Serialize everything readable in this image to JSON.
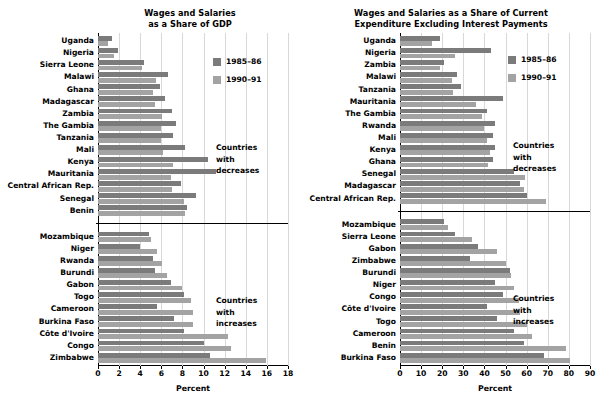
{
  "chart_data": [
    {
      "id": "left",
      "type": "bar",
      "orientation": "horizontal",
      "title": "Wages and Salaries\nas a Share of GDP",
      "title_line1": "Wages and Salaries",
      "title_line2": "as a Share of GDP",
      "xlabel": "Percent",
      "ylabel": "",
      "xlim": [
        0,
        18
      ],
      "xticks": [
        0,
        2,
        4,
        6,
        8,
        10,
        12,
        14,
        16,
        18
      ],
      "grid": "vertical",
      "legend": [
        "1985–86",
        "1990–91"
      ],
      "legend_position": "upper-right-inside",
      "series_colors": {
        "1985–86": "#7b7b7b",
        "1990–91": "#a3a3a3"
      },
      "groups": [
        {
          "annotation": "Countries\nwith\ndecreases",
          "annotation_lines": [
            "Countries",
            "with",
            "decreases"
          ],
          "categories": [
            "Uganda",
            "Nigeria",
            "Sierra Leone",
            "Malawi",
            "Ghana",
            "Madagascar",
            "Zambia",
            "The Gambia",
            "Tanzania",
            "Mali",
            "Kenya",
            "Mauritania",
            "Central African Rep.",
            "Senegal",
            "Benin"
          ],
          "series": [
            {
              "name": "1985–86",
              "values": [
                1.3,
                1.9,
                4.4,
                6.6,
                5.9,
                6.3,
                7.0,
                7.4,
                7.1,
                8.2,
                10.4,
                11.2,
                7.9,
                9.3,
                8.4
              ]
            },
            {
              "name": "1990–91",
              "values": [
                0.9,
                1.5,
                4.2,
                5.5,
                5.2,
                5.4,
                6.1,
                6.0,
                6.0,
                6.2,
                7.1,
                6.9,
                7.0,
                8.1,
                8.2
              ]
            }
          ]
        },
        {
          "annotation": "Countries\nwith\nincreases",
          "annotation_lines": [
            "Countries",
            "with",
            "increases"
          ],
          "categories": [
            "Mozambique",
            "Niger",
            "Rwanda",
            "Burundi",
            "Gabon",
            "Togo",
            "Cameroon",
            "Burkina Faso",
            "Côte d'Ivoire",
            "Congo",
            "Zimbabwe"
          ],
          "series": [
            {
              "name": "1985–86",
              "values": [
                4.8,
                4.0,
                5.2,
                5.4,
                6.9,
                8.1,
                5.6,
                7.2,
                8.1,
                10.0,
                10.6
              ]
            },
            {
              "name": "1990–91",
              "values": [
                5.0,
                5.6,
                6.1,
                6.5,
                8.0,
                8.8,
                9.0,
                9.0,
                12.3,
                12.6,
                15.9
              ]
            }
          ]
        }
      ]
    },
    {
      "id": "right",
      "type": "bar",
      "orientation": "horizontal",
      "title": "Wages and Salaries as a Share of Current\nExpenditure Excluding Interest Payments",
      "title_line1": "Wages and Salaries as a Share of Current",
      "title_line2": "Expenditure Excluding Interest Payments",
      "xlabel": "Percent",
      "ylabel": "",
      "xlim": [
        0,
        90
      ],
      "xticks": [
        0,
        10,
        20,
        30,
        40,
        50,
        60,
        70,
        80,
        90
      ],
      "grid": "vertical",
      "legend": [
        "1985–86",
        "1990–91"
      ],
      "legend_position": "upper-right-inside",
      "series_colors": {
        "1985–86": "#7b7b7b",
        "1990–91": "#a3a3a3"
      },
      "groups": [
        {
          "annotation": "Countries\nwith\ndecreases",
          "annotation_lines": [
            "Countries",
            "with",
            "decreases"
          ],
          "categories": [
            "Uganda",
            "Nigeria",
            "Zambia",
            "Malawi",
            "Tanzania",
            "Mauritania",
            "The Gambia",
            "Rwanda",
            "Mali",
            "Kenya",
            "Ghana",
            "Senegal",
            "Madagascar",
            "Central African Rep."
          ],
          "series": [
            {
              "name": "1985–86",
              "values": [
                19.0,
                43.0,
                21.0,
                27.0,
                29.0,
                49.0,
                41.0,
                45.0,
                44.0,
                45.0,
                44.0,
                54.0,
                57.0,
                60.0
              ]
            },
            {
              "name": "1990–91",
              "values": [
                15.0,
                26.0,
                19.0,
                24.5,
                25.0,
                36.0,
                39.0,
                40.0,
                41.0,
                42.5,
                41.5,
                59.0,
                58.5,
                69.0
              ]
            }
          ]
        },
        {
          "annotation": "Countries\nwith\nincreases",
          "annotation_lines": [
            "Countries",
            "with",
            "increases"
          ],
          "categories": [
            "Mozambique",
            "Sierra Leone",
            "Gabon",
            "Zimbabwe",
            "Burundi",
            "Niger",
            "Congo",
            "Côte d'Ivoire",
            "Togo",
            "Cameroon",
            "Benin",
            "Burkina Faso"
          ],
          "series": [
            {
              "name": "1985–86",
              "values": [
                21.0,
                26.0,
                37.0,
                33.0,
                52.0,
                45.0,
                49.0,
                41.0,
                46.0,
                54.0,
                58.5,
                68.0
              ]
            },
            {
              "name": "1990–91",
              "values": [
                22.5,
                34.0,
                46.0,
                50.0,
                52.5,
                54.0,
                56.5,
                57.0,
                60.0,
                62.5,
                78.5,
                80.5
              ]
            }
          ]
        }
      ]
    }
  ]
}
